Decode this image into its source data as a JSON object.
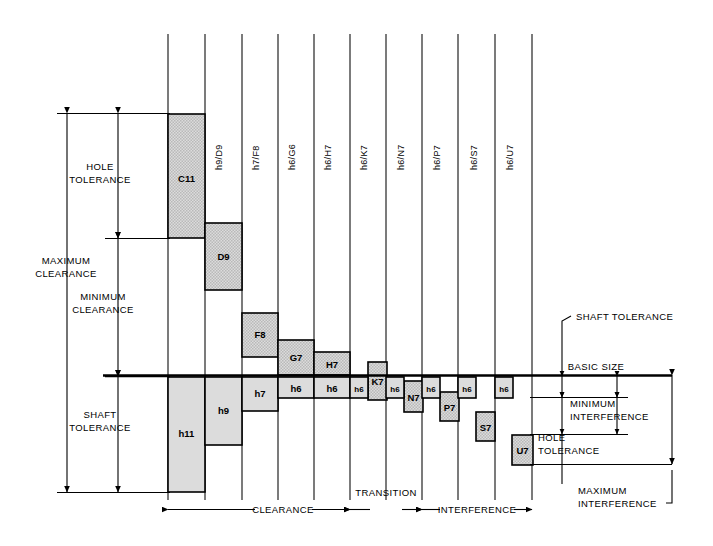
{
  "diagram": {
    "basic_size_label": "BASIC SIZE",
    "left_labels": {
      "hole_tolerance": [
        "HOLE",
        "TOLERANCE"
      ],
      "maximum_clearance": [
        "MAXIMUM",
        "CLEARANCE"
      ],
      "minimum_clearance": [
        "MINIMUM",
        "CLEARANCE"
      ],
      "shaft_tolerance": [
        "SHAFT",
        "TOLERANCE"
      ]
    },
    "right_labels": {
      "shaft_tolerance": "SHAFT TOLERANCE",
      "minimum_interference": [
        "MINIMUM",
        "INTERFERENCE"
      ],
      "hole_tolerance": [
        "HOLE",
        "TOLERANCE"
      ],
      "maximum_interference": [
        "MAXIMUM",
        "INTERFERENCE"
      ]
    },
    "bottom_zones": [
      {
        "name": "CLEARANCE",
        "x1": 168,
        "x2": 350
      },
      {
        "name": "TRANSITION",
        "x1": 350,
        "x2": 422
      },
      {
        "name": "INTERFERENCE",
        "x1": 422,
        "x2": 532
      }
    ],
    "column_labels": [
      {
        "text": "h11/C11",
        "x": 186
      },
      {
        "text": "h9/D9",
        "x": 222
      },
      {
        "text": "h7/F8",
        "x": 259
      },
      {
        "text": "h6/G6",
        "x": 295
      },
      {
        "text": "h6/H7",
        "x": 331
      },
      {
        "text": "h6/K7",
        "x": 367
      },
      {
        "text": "h6/N7",
        "x": 404
      },
      {
        "text": "h6/P7",
        "x": 440
      },
      {
        "text": "h6/S7",
        "x": 477
      },
      {
        "text": "h6/U7",
        "x": 513
      }
    ],
    "column_lines": [
      168,
      205,
      242,
      278,
      314,
      350,
      386,
      422,
      458,
      495,
      532
    ],
    "hole_boxes": [
      {
        "label": "C11",
        "x": 168,
        "y": 114,
        "w": 37,
        "h": 124,
        "font": "normal"
      },
      {
        "label": "D9",
        "x": 205,
        "y": 223,
        "w": 37,
        "h": 67,
        "font": "normal"
      },
      {
        "label": "F8",
        "x": 242,
        "y": 313,
        "w": 36,
        "h": 44,
        "font": "normal"
      },
      {
        "label": "G7",
        "x": 278,
        "y": 340,
        "w": 36,
        "h": 35,
        "font": "normal"
      },
      {
        "label": "H7",
        "x": 314,
        "y": 352,
        "w": 36,
        "h": 23,
        "font": "normal"
      },
      {
        "label": "K7",
        "x": 368,
        "y": 362,
        "w": 19,
        "h": 38,
        "font": "normal"
      },
      {
        "label": "N7",
        "x": 404,
        "y": 381,
        "w": 19,
        "h": 31,
        "font": "normal"
      },
      {
        "label": "P7",
        "x": 440,
        "y": 392,
        "w": 19,
        "h": 29,
        "font": "normal"
      },
      {
        "label": "S7",
        "x": 476,
        "y": 412,
        "w": 19,
        "h": 29,
        "font": "normal"
      },
      {
        "label": "U7",
        "x": 512,
        "y": 435,
        "w": 21,
        "h": 30,
        "font": "normal"
      }
    ],
    "shaft_boxes": [
      {
        "label": "h11",
        "x": 168,
        "y": 377,
        "w": 37,
        "h": 115
      },
      {
        "label": "h9",
        "x": 205,
        "y": 377,
        "w": 37,
        "h": 68
      },
      {
        "label": "h7",
        "x": 242,
        "y": 377,
        "w": 36,
        "h": 34
      },
      {
        "label": "h6",
        "x": 278,
        "y": 377,
        "w": 36,
        "h": 21
      },
      {
        "label": "h6",
        "x": 314,
        "y": 377,
        "w": 36,
        "h": 21
      },
      {
        "label": "h6",
        "x": 350,
        "y": 377,
        "w": 18,
        "h": 21
      },
      {
        "label": "h6",
        "x": 386,
        "y": 377,
        "w": 18,
        "h": 21
      },
      {
        "label": "h6",
        "x": 422,
        "y": 377,
        "w": 18,
        "h": 21
      },
      {
        "label": "h6",
        "x": 458,
        "y": 377,
        "w": 18,
        "h": 21
      },
      {
        "label": "h6",
        "x": 495,
        "y": 377,
        "w": 18,
        "h": 21
      }
    ],
    "colors": {
      "hole_fill": "#d9d9d9",
      "shaft_fill": "#d9d9d9",
      "line": "#000000",
      "background": "#ffffff"
    },
    "basic_size_line_y": 375
  }
}
